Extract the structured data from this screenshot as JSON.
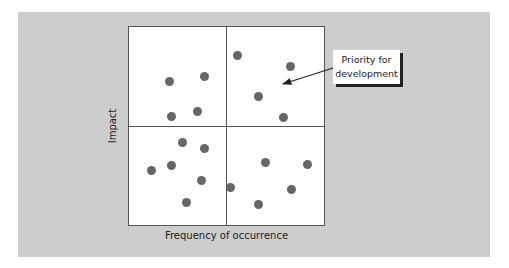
{
  "callout": {
    "line1": "Priority for",
    "line2": "development"
  },
  "axes": {
    "x_label": "Frequency of occurrence",
    "y_label": "Impact"
  },
  "chart_data": {
    "type": "scatter",
    "title": "",
    "xlabel": "Frequency of occurrence",
    "ylabel": "Impact",
    "quadrants": "2x2 matrix split at midpoints",
    "annotation": {
      "text": "Priority for development",
      "points_to": "top-right quadrant (high frequency, high impact)"
    },
    "points_px": [
      [
        169,
        81
      ],
      [
        204,
        76
      ],
      [
        171,
        116
      ],
      [
        197,
        111
      ],
      [
        237,
        55
      ],
      [
        290,
        66
      ],
      [
        258,
        96
      ],
      [
        283,
        117
      ],
      [
        182,
        142
      ],
      [
        204,
        148
      ],
      [
        171,
        165
      ],
      [
        151,
        170
      ],
      [
        201,
        180
      ],
      [
        186,
        202
      ],
      [
        265,
        162
      ],
      [
        307,
        164
      ],
      [
        230,
        187
      ],
      [
        291,
        189
      ],
      [
        258,
        204
      ]
    ]
  }
}
